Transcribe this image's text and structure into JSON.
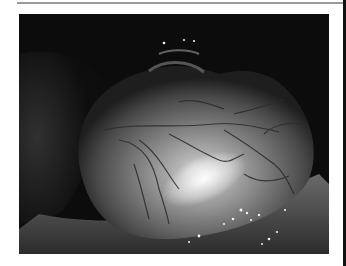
{
  "figure": {
    "colors": {
      "background": "#ffffff",
      "photo_dark": "#0c0c0c",
      "tissue_mid": "#8a8a8a",
      "highlight": "#f4f4f4",
      "vessel": "#2a2a2a",
      "top_rule": "#9a9a9a",
      "right_strip": "#111111"
    }
  }
}
